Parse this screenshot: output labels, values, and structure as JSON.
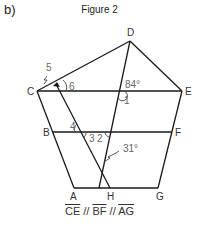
{
  "part_label": "b)",
  "title": "Figure 2",
  "points": {
    "D": {
      "label": "D",
      "x": 130,
      "y": 41
    },
    "C": {
      "label": "C",
      "x": 37,
      "y": 91
    },
    "E": {
      "label": "E",
      "x": 182,
      "y": 91
    },
    "B": {
      "label": "B",
      "x": 53,
      "y": 132
    },
    "F": {
      "label": "F",
      "x": 172,
      "y": 132
    },
    "A": {
      "label": "A",
      "x": 74,
      "y": 188
    },
    "H": {
      "label": "H",
      "x": 110,
      "y": 188
    },
    "G": {
      "label": "G",
      "x": 158,
      "y": 188
    }
  },
  "angles": {
    "a84": "84°",
    "a31": "31°",
    "n1": "1",
    "n2": "2",
    "n3": "3",
    "n4": "4",
    "n5": "5",
    "n6": "6"
  },
  "caption": {
    "seg1": "CE",
    "sep1": " // ",
    "seg2": "BF",
    "sep2": " // ",
    "seg3": "AG"
  },
  "colors": {
    "line": "#1a1a1a",
    "text": "#333333",
    "angle_text": "#666666"
  }
}
